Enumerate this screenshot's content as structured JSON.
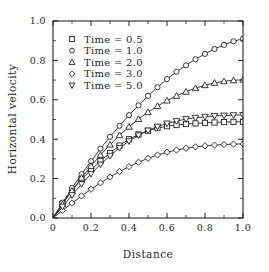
{
  "chart_data": {
    "type": "line",
    "title": "",
    "xlabel": "Distance",
    "ylabel": "Horizontal velocity",
    "xlim": [
      0.0,
      1.0
    ],
    "ylim": [
      0.0,
      1.0
    ],
    "grid": false,
    "legend_position": "upper-left",
    "xticks": [
      "0",
      "0.2",
      "0.4",
      "0.6",
      "0.8",
      "1.0"
    ],
    "xtick_values": [
      0.0,
      0.2,
      0.4,
      0.6,
      0.8,
      1.0
    ],
    "yticks": [
      "0.0",
      "0.2",
      "0.4",
      "0.6",
      "0.8",
      "1.0"
    ],
    "ytick_values": [
      0.0,
      0.2,
      0.4,
      0.6,
      0.8,
      1.0
    ],
    "x": [
      0.0,
      0.05,
      0.1,
      0.15,
      0.2,
      0.25,
      0.3,
      0.35,
      0.4,
      0.45,
      0.5,
      0.55,
      0.6,
      0.65,
      0.7,
      0.75,
      0.8,
      0.85,
      0.9,
      0.95,
      1.0
    ],
    "series": [
      {
        "name": "Time = 0.5",
        "marker": "square",
        "values": [
          0.0,
          0.072,
          0.14,
          0.198,
          0.243,
          0.29,
          0.33,
          0.368,
          0.4,
          0.424,
          0.443,
          0.456,
          0.466,
          0.472,
          0.477,
          0.48,
          0.483,
          0.485,
          0.487,
          0.488,
          0.489
        ]
      },
      {
        "name": "Time = 1.0",
        "marker": "circle",
        "values": [
          0.0,
          0.078,
          0.152,
          0.222,
          0.288,
          0.352,
          0.412,
          0.468,
          0.522,
          0.572,
          0.62,
          0.664,
          0.705,
          0.742,
          0.775,
          0.806,
          0.833,
          0.858,
          0.879,
          0.897,
          0.91
        ]
      },
      {
        "name": "Time = 2.0",
        "marker": "triangle",
        "values": [
          0.0,
          0.07,
          0.138,
          0.204,
          0.264,
          0.32,
          0.372,
          0.42,
          0.463,
          0.502,
          0.537,
          0.568,
          0.596,
          0.62,
          0.641,
          0.659,
          0.674,
          0.686,
          0.694,
          0.699,
          0.702
        ]
      },
      {
        "name": "Time = 3.0",
        "marker": "diamond",
        "values": [
          0.0,
          0.038,
          0.076,
          0.112,
          0.146,
          0.178,
          0.208,
          0.236,
          0.261,
          0.283,
          0.303,
          0.32,
          0.334,
          0.345,
          0.354,
          0.361,
          0.366,
          0.37,
          0.373,
          0.375,
          0.376
        ]
      },
      {
        "name": "Time = 5.0",
        "marker": "triangle-down",
        "values": [
          0.0,
          0.058,
          0.116,
          0.172,
          0.224,
          0.272,
          0.316,
          0.356,
          0.39,
          0.42,
          0.444,
          0.464,
          0.48,
          0.492,
          0.502,
          0.509,
          0.514,
          0.518,
          0.52,
          0.522,
          0.523
        ]
      }
    ]
  },
  "axes": {
    "x_label": "Distance",
    "y_label": "Horizontal velocity"
  },
  "legend": {
    "entries": [
      {
        "label": "Time = 0.5",
        "marker": "square"
      },
      {
        "label": "Time = 1.0",
        "marker": "circle"
      },
      {
        "label": "Time = 2.0",
        "marker": "triangle"
      },
      {
        "label": "Time = 3.0",
        "marker": "diamond"
      },
      {
        "label": "Time = 5.0",
        "marker": "triangle-down"
      }
    ]
  },
  "style": {
    "line_color": "#242424",
    "marker_fill": "#ffffff",
    "background": "#ffffff"
  }
}
